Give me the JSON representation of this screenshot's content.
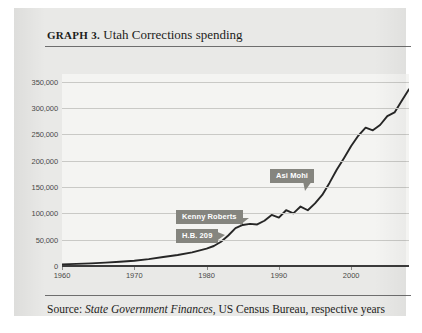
{
  "header": {
    "label": "GRAPH 3.",
    "title": "Utah Corrections spending"
  },
  "source": {
    "prefix": "Source:",
    "publication": "State Government Finances",
    "suffix": ", US Census Bureau, respective years"
  },
  "callouts": [
    {
      "id": "kenny-roberts",
      "label": "Kenny Roberts"
    },
    {
      "id": "hb-209",
      "label": "H.B. 209"
    },
    {
      "id": "asi-mohi",
      "label": "Asi Mohi"
    }
  ],
  "colors": {
    "page_background": "#e9e9e7",
    "plot_background": "#f4f4f2",
    "line": "#262626",
    "gridline": "#c9c9c6",
    "axis": "#3b3b3b",
    "callout": "#85857f",
    "callout_text": "#ffffff",
    "tick_text": "#4a4a48",
    "title_text": "#1d1d1b"
  },
  "chart_data": {
    "type": "line",
    "title": "Utah Corrections spending",
    "xlabel": "",
    "ylabel": "",
    "xlim": [
      1960,
      2008
    ],
    "ylim": [
      0,
      365000
    ],
    "grid": true,
    "legend": "none",
    "ytick_labels": [
      "0",
      "50,000",
      "100,000",
      "150,000",
      "200,000",
      "250,000",
      "300,000",
      "350,000"
    ],
    "ytick_values": [
      0,
      50000,
      100000,
      150000,
      200000,
      250000,
      300000,
      350000
    ],
    "xtick_labels": [
      "1960",
      "1970",
      "1980",
      "1990",
      "2000"
    ],
    "xtick_values": [
      1960,
      1970,
      1980,
      1990,
      2000
    ],
    "series": [
      {
        "name": "Utah Corrections spending",
        "x": [
          1960,
          1962,
          1964,
          1966,
          1968,
          1970,
          1972,
          1974,
          1976,
          1978,
          1980,
          1981,
          1982,
          1983,
          1984,
          1985,
          1986,
          1987,
          1988,
          1989,
          1990,
          1991,
          1992,
          1993,
          1994,
          1995,
          1996,
          1997,
          1998,
          1999,
          2000,
          2001,
          2002,
          2003,
          2004,
          2005,
          2006,
          2007,
          2008
        ],
        "values": [
          3000,
          4000,
          5000,
          6500,
          8000,
          10000,
          13000,
          17000,
          21000,
          26000,
          33000,
          38000,
          46000,
          58000,
          72000,
          78000,
          80000,
          79000,
          86000,
          97000,
          92000,
          106000,
          100000,
          113000,
          106000,
          119000,
          135000,
          158000,
          183000,
          205000,
          228000,
          248000,
          263000,
          258000,
          268000,
          285000,
          292000,
          314000,
          336000
        ]
      }
    ],
    "annotations": [
      {
        "label": "Kenny Roberts",
        "x": 1983,
        "y": 58000
      },
      {
        "label": "H.B. 209",
        "x": 1984,
        "y": 72000
      },
      {
        "label": "Asi Mohi",
        "x": 1996,
        "y": 135000
      }
    ]
  }
}
